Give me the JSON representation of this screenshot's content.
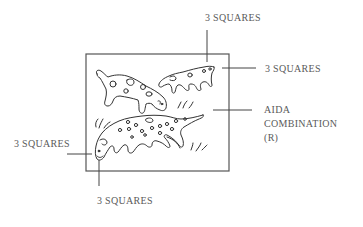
{
  "diagram": {
    "line_color": "#555555",
    "text_color": "#5a5a5a",
    "labels": {
      "top": "3 SQUARES",
      "right_top": "3 SQUARES",
      "right_aida": [
        "AIDA",
        "COMBINATION",
        "(R)"
      ],
      "left": "3 SQUARES",
      "bottom": "3 SQUARES"
    },
    "figures": [
      {
        "name": "upper-left-dog",
        "description": "spotted dog facing right, head lowered"
      },
      {
        "name": "upper-right-dog",
        "description": "small spotted dog facing left"
      },
      {
        "name": "bottom-dog",
        "description": "long spotted dog facing left, head lowered"
      }
    ]
  }
}
